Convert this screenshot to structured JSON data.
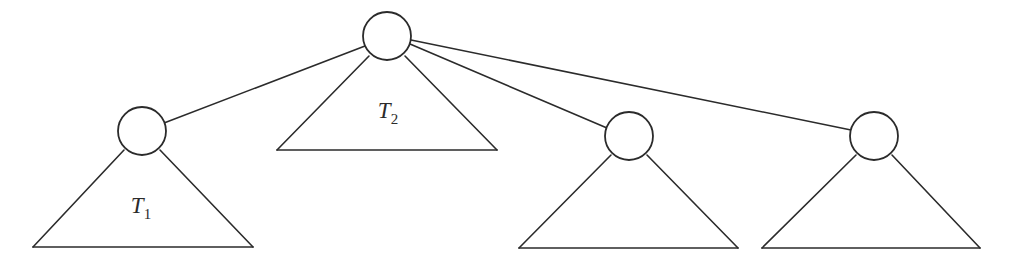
{
  "diagram": {
    "kind": "tree-diagram",
    "background_color": "#ffffff",
    "stroke_color": "#2b2b2b",
    "node_fill_color": "#ffffff",
    "canvas": {
      "width": 1012,
      "height": 259
    },
    "nodes": [
      {
        "id": "root",
        "name": "root-node",
        "cx": 387,
        "cy": 36,
        "r": 24,
        "label": ""
      },
      {
        "id": "child1",
        "name": "child-node-1",
        "cx": 142,
        "cy": 131,
        "r": 24,
        "label": ""
      },
      {
        "id": "child3",
        "name": "child-node-3",
        "cx": 629,
        "cy": 136,
        "r": 24,
        "label": ""
      },
      {
        "id": "child4",
        "name": "child-node-4",
        "cx": 874,
        "cy": 136,
        "r": 24,
        "label": ""
      }
    ],
    "edges": [
      {
        "id": "e1",
        "name": "edge-root-to-child1",
        "from": "root",
        "to": "child1",
        "x1": 365,
        "y1": 46,
        "x2": 164,
        "y2": 123
      },
      {
        "id": "e2",
        "name": "edge-root-to-child3",
        "from": "root",
        "to": "child3",
        "x1": 410,
        "y1": 44,
        "x2": 607,
        "y2": 128
      },
      {
        "id": "e3",
        "name": "edge-root-to-child4",
        "from": "root",
        "to": "child4",
        "x1": 411,
        "y1": 40,
        "x2": 851,
        "y2": 130
      }
    ],
    "subtrees": [
      {
        "id": "t1",
        "name": "subtree-triangle-1",
        "label": "T",
        "subscript": "1",
        "apex_x": 142,
        "apex_y": 152,
        "base_y": 247,
        "base_left_x": 33,
        "base_right_x": 253,
        "label_x": 141,
        "label_y": 213
      },
      {
        "id": "t2",
        "name": "subtree-triangle-2",
        "label": "T",
        "subscript": "2",
        "apex_x": 387,
        "apex_y": 58,
        "base_y": 150,
        "base_left_x": 277,
        "base_right_x": 497,
        "label_x": 388,
        "label_y": 118
      },
      {
        "id": "t3",
        "name": "subtree-triangle-3",
        "label": "",
        "subscript": "",
        "apex_x": 629,
        "apex_y": 158,
        "base_y": 248,
        "base_left_x": 519,
        "base_right_x": 738,
        "label_x": 629,
        "label_y": 218
      },
      {
        "id": "t4",
        "name": "subtree-triangle-4",
        "label": "",
        "subscript": "",
        "apex_x": 874,
        "apex_y": 158,
        "base_y": 248,
        "base_left_x": 762,
        "base_right_x": 980,
        "label_x": 874,
        "label_y": 218
      }
    ]
  }
}
